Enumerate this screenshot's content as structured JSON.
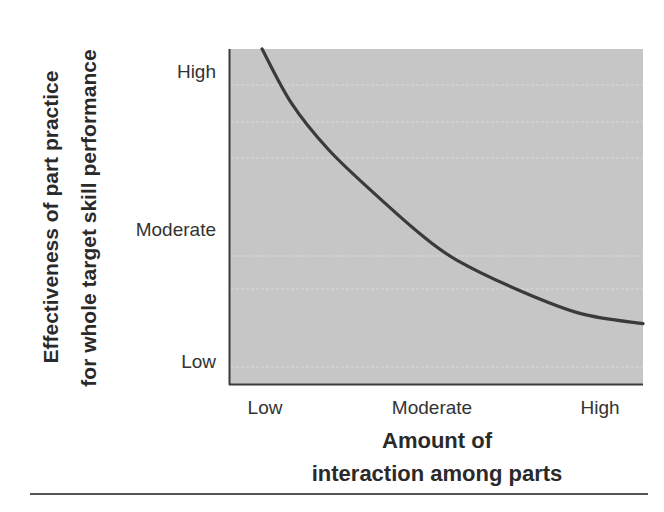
{
  "chart_data": {
    "type": "line",
    "title": "",
    "xlabel": "Amount of interaction among parts",
    "xlabel_lines": [
      "Amount of",
      "interaction among parts"
    ],
    "ylabel": "Effectiveness of part practice for whole target skill performance",
    "ylabel_lines": [
      "Effectiveness of part practice",
      "for whole target skill performance"
    ],
    "x_ticks": [
      "Low",
      "Moderate",
      "High"
    ],
    "y_ticks": [
      "High",
      "Moderate",
      "Low"
    ],
    "xlim": [
      0,
      1
    ],
    "ylim": [
      0,
      1
    ],
    "grid": true,
    "legend": null,
    "series": [
      {
        "name": "Effectiveness of part practice",
        "x": [
          0.08,
          0.15,
          0.24,
          0.35,
          0.46,
          0.55,
          0.7,
          0.85,
          1.0
        ],
        "y": [
          1.0,
          0.84,
          0.7,
          0.57,
          0.45,
          0.37,
          0.28,
          0.21,
          0.18
        ]
      }
    ],
    "colors": {
      "plot_fill": "#c6c6c6",
      "curve": "#3a3a3a",
      "axis": "#3a3a3a"
    }
  }
}
